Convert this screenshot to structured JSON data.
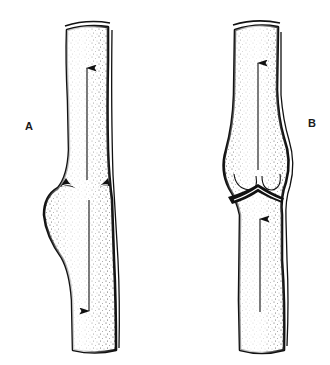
{
  "figure": {
    "panels": [
      {
        "label": "A",
        "state": "valve cusps open at mid-segment; dilation below the valve",
        "arrows": [
          {
            "direction": "up",
            "position": "upper segment"
          },
          {
            "direction": "down",
            "position": "lower segment"
          }
        ]
      },
      {
        "label": "B",
        "state": "valve cusps closed; sinus bulge above the valve",
        "arrows": [
          {
            "direction": "up",
            "position": "upper segment"
          },
          {
            "direction": "up",
            "position": "lower segment"
          }
        ]
      }
    ],
    "colors": {
      "ink": "#111111",
      "background": "#ffffff"
    }
  }
}
